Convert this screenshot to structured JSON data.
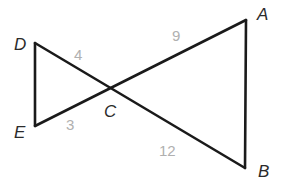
{
  "figure": {
    "kind": "geometry-diagram",
    "background_color": "#ffffff",
    "stroke_color": "#1a1a1a",
    "stroke_width": 2.6,
    "vertex_label_color": "#2b2b2b",
    "side_label_color": "#b0b0b0",
    "vertices": [
      {
        "id": "A",
        "label": "A",
        "x": 246,
        "y": 20
      },
      {
        "id": "B",
        "label": "B",
        "x": 245,
        "y": 168
      },
      {
        "id": "C",
        "label": "C",
        "x": 108,
        "y": 88
      },
      {
        "id": "D",
        "label": "D",
        "x": 35,
        "y": 43
      },
      {
        "id": "E",
        "label": "E",
        "x": 35,
        "y": 126
      }
    ],
    "segments": [
      {
        "id": "DE",
        "from": "D",
        "to": "E"
      },
      {
        "id": "DB",
        "from": "D",
        "to": "B"
      },
      {
        "id": "EA",
        "from": "E",
        "to": "A"
      },
      {
        "id": "AB",
        "from": "A",
        "to": "B"
      }
    ],
    "side_labels": [
      {
        "id": "DC",
        "segment": "D-C",
        "value": "4"
      },
      {
        "id": "EC",
        "segment": "E-C",
        "value": "3"
      },
      {
        "id": "CA",
        "segment": "C-A",
        "value": "9"
      },
      {
        "id": "CB",
        "segment": "C-B",
        "value": "12"
      }
    ]
  }
}
